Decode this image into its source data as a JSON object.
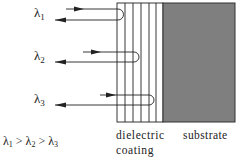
{
  "diagram": {
    "beams": [
      {
        "label": "λ",
        "subscript": "1",
        "in_y": 9,
        "out_y": 20,
        "turn_x": 123
      },
      {
        "label": "λ",
        "subscript": "2",
        "in_y": 52,
        "out_y": 62,
        "turn_x": 139
      },
      {
        "label": "λ",
        "subscript": "3",
        "in_y": 95,
        "out_y": 105,
        "turn_x": 154
      }
    ],
    "relation": {
      "parts": [
        "λ",
        "1",
        " > ",
        "λ",
        "2",
        " > ",
        "λ",
        "3"
      ]
    },
    "coating_label_line1": "dielectric",
    "coating_label_line2": "coating",
    "substrate_label": "substrate",
    "colors": {
      "line": "#222222",
      "substrate_fill": "#7f7f7f",
      "background": "#ffffff"
    }
  }
}
